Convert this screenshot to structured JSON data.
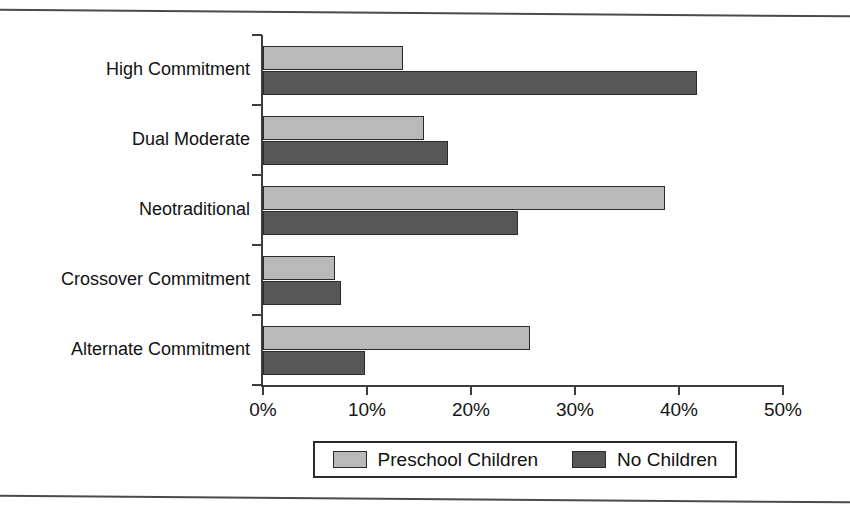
{
  "chart_data": {
    "type": "bar",
    "orientation": "horizontal",
    "title": "",
    "xlabel": "",
    "ylabel": "",
    "xlim": [
      0,
      50
    ],
    "xtick_values": [
      0,
      10,
      20,
      30,
      40,
      50
    ],
    "xtick_labels": [
      "0%",
      "10%",
      "20%",
      "30%",
      "40%",
      "50%"
    ],
    "grid": false,
    "legend_position": "bottom",
    "categories": [
      "High Commitment",
      "Dual Moderate",
      "Neotraditional",
      "Crossover Commitment",
      "Alternate Commitment"
    ],
    "series": [
      {
        "name": "Preschool Children",
        "color": "#b9b9b9",
        "values": [
          13.5,
          15.5,
          38.7,
          6.9,
          25.7
        ]
      },
      {
        "name": "No Children",
        "color": "#575757",
        "values": [
          41.7,
          17.8,
          24.5,
          7.5,
          9.8
        ]
      }
    ]
  },
  "legend": {
    "items": [
      {
        "label": "Preschool Children"
      },
      {
        "label": "No Children"
      }
    ]
  }
}
